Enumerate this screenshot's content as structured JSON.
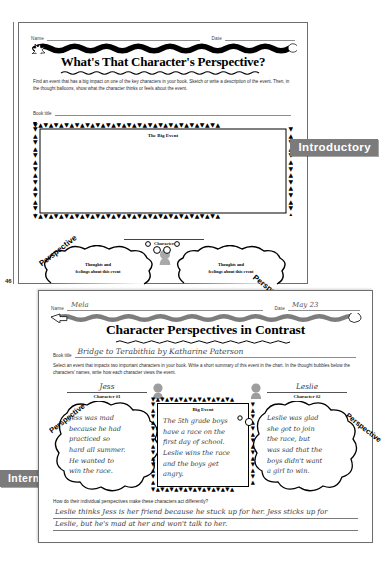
{
  "page": {
    "page_number": "46"
  },
  "banners": {
    "introductory": "Introductory",
    "intermediate": "Intermediate"
  },
  "sheet1": {
    "name_label": "Name",
    "name_value": "",
    "date_label": "Date",
    "date_value": "",
    "title": "What's That Character's Perspective?",
    "instructions": "Find an event that has a big impact on one of the key characters in your book. Sketch or write a description of the event. Then, in the thought balloons, show what the character thinks or feels about the event.",
    "book_title_label": "Book title",
    "book_title_value": "",
    "big_event_label": "The Big Event",
    "character_label": "Character",
    "character_value": "",
    "perspective_left": "Perspective",
    "perspective_right": "Perspective",
    "bubble_left_line1": "Thoughts and",
    "bubble_left_line2": "feelings about this event",
    "bubble_right_line1": "Thoughts and",
    "bubble_right_line2": "feelings about this event"
  },
  "sheet2": {
    "name_label": "Name",
    "name_value": "Mela",
    "date_label": "Date",
    "date_value": "May 23",
    "title": "Character Perspectives in Contrast",
    "book_title_label": "Book title",
    "book_title_value": "Bridge to Terabithia by Katharine Paterson",
    "instructions": "Select an event that impacts two important characters in your book. Write a short summary of this event in the chart. In the thought bubbles below the characters' names, write how each character views the event.",
    "character1_name": "Jess",
    "character1_label": "Character #1",
    "character2_name": "Leslie",
    "character2_label": "Character #2",
    "perspective_left": "Perspective",
    "perspective_right": "Perspective",
    "big_event_label": "Big Event",
    "big_event_lines": [
      "The 5th grade boys",
      "have a race on the",
      "first day of school.",
      "Leslie wins the race",
      "and the boys get",
      "angry."
    ],
    "bubble_left_lines": [
      "Jess was mad",
      "because he had",
      "practiced so",
      "hard all summer.",
      "He wanted to",
      "win the race."
    ],
    "bubble_right_lines": [
      "Leslie was glad",
      "she got to join",
      "the race, but",
      "was sad that the",
      "boys didn't want",
      "a girl to win."
    ],
    "question": "How do their individual perspectives make these characters act differently?",
    "answer_line1": "Leslie thinks Jess is her friend because he stuck up for her. Jess sticks up for",
    "answer_line2": "Leslie, but he's mad at her and won't talk to her."
  },
  "colors": {
    "banner_gray": "#7b7b7b",
    "ink": "#111111",
    "hand_ink": "#3b3b3b"
  }
}
